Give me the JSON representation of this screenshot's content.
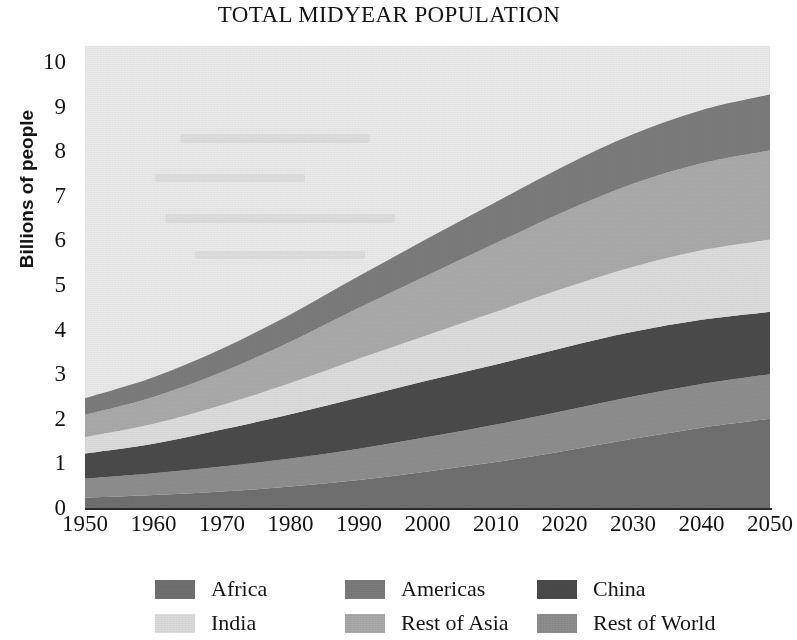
{
  "chart_data": {
    "type": "area",
    "stacked": true,
    "title": "TOTAL MIDYEAR POPULATION",
    "xlabel": "",
    "ylabel": "Billions of people",
    "x": [
      1950,
      1960,
      1970,
      1980,
      1990,
      2000,
      2010,
      2020,
      2030,
      2040,
      2050
    ],
    "xlim": [
      1950,
      2050
    ],
    "ylim": [
      0,
      10
    ],
    "ytick_labels": [
      "10",
      "9",
      "8",
      "7",
      "6",
      "5",
      "4",
      "3",
      "2",
      "1",
      "0"
    ],
    "xtick_labels": [
      "1950",
      "1960",
      "1970",
      "1980",
      "1990",
      "2000",
      "2010",
      "2020",
      "2030",
      "2040",
      "2050"
    ],
    "grid": false,
    "legend_position": "bottom",
    "stack_order_bottom_to_top": [
      "Africa",
      "Rest of World",
      "China",
      "India",
      "Rest of Asia",
      "Americas"
    ],
    "series": [
      {
        "name": "Africa",
        "color": "#6f6f6f",
        "values": [
          0.23,
          0.29,
          0.37,
          0.48,
          0.63,
          0.82,
          1.03,
          1.28,
          1.55,
          1.8,
          2.0
        ]
      },
      {
        "name": "Rest of World",
        "color": "#8d8d8d",
        "values": [
          0.43,
          0.49,
          0.56,
          0.63,
          0.7,
          0.77,
          0.84,
          0.9,
          0.95,
          0.98,
          1.0
        ]
      },
      {
        "name": "China",
        "color": "#4a4a4a",
        "values": [
          0.56,
          0.66,
          0.83,
          0.99,
          1.15,
          1.27,
          1.35,
          1.42,
          1.45,
          1.44,
          1.4
        ]
      },
      {
        "name": "India",
        "color": "#dcdcdc",
        "values": [
          0.37,
          0.45,
          0.55,
          0.7,
          0.87,
          1.02,
          1.18,
          1.33,
          1.46,
          1.56,
          1.62
        ]
      },
      {
        "name": "Rest of Asia",
        "color": "#a9a9a9",
        "values": [
          0.5,
          0.6,
          0.74,
          0.93,
          1.14,
          1.34,
          1.54,
          1.72,
          1.86,
          1.95,
          2.0
        ]
      },
      {
        "name": "Americas",
        "color": "#7b7b7b",
        "values": [
          0.37,
          0.44,
          0.52,
          0.61,
          0.71,
          0.82,
          0.92,
          1.02,
          1.11,
          1.19,
          1.25
        ]
      }
    ],
    "totals": [
      2.46,
      2.93,
      3.57,
      4.34,
      5.2,
      6.04,
      6.86,
      7.67,
      8.38,
      8.92,
      9.27
    ],
    "legend_rows": [
      [
        "Africa",
        "Americas",
        "China"
      ],
      [
        "India",
        "Rest of Asia",
        "Rest of World"
      ]
    ]
  },
  "colors": {
    "plot_background": "#e9e9e9",
    "axis": "#2a2a2a",
    "text": "#141414",
    "page_background": "#ffffff"
  },
  "legend": {
    "items": [
      {
        "label": "Africa",
        "color": "#6f6f6f",
        "row": 0,
        "col": 0
      },
      {
        "label": "Americas",
        "color": "#7b7b7b",
        "row": 0,
        "col": 1
      },
      {
        "label": "China",
        "color": "#4a4a4a",
        "row": 0,
        "col": 2
      },
      {
        "label": "India",
        "color": "#dcdcdc",
        "row": 1,
        "col": 0
      },
      {
        "label": "Rest of Asia",
        "color": "#a9a9a9",
        "row": 1,
        "col": 1
      },
      {
        "label": "Rest of World",
        "color": "#8d8d8d",
        "row": 1,
        "col": 2
      }
    ]
  }
}
